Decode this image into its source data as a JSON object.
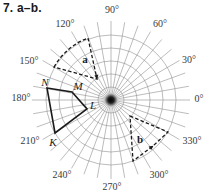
{
  "exercise_label": "7. a–b.",
  "polar_grid": {
    "center": [
      111,
      100
    ],
    "ray_step_deg": 10,
    "ray_length": 79,
    "circle_radii": [
      13,
      26,
      39,
      52,
      65
    ],
    "grid_color": "#8e8e8e"
  },
  "angle_labels": [
    {
      "text": "0°",
      "transform": "translate(199,100)"
    },
    {
      "text": "30°",
      "transform": "translate(189,61)"
    },
    {
      "text": "60°",
      "transform": "translate(160,25)"
    },
    {
      "text": "90°",
      "transform": "translate(112,11)"
    },
    {
      "text": "120°",
      "transform": "translate(65,25)"
    },
    {
      "text": "150°",
      "transform": "translate(29,62)"
    },
    {
      "text": "180°",
      "transform": "translate(21,99)"
    },
    {
      "text": "210°",
      "transform": "translate(30,142)"
    },
    {
      "text": "240°",
      "transform": "translate(62,176)"
    },
    {
      "text": "270°",
      "transform": "translate(112,188)"
    },
    {
      "text": "300°",
      "transform": "translate(159,176)"
    },
    {
      "text": "330°",
      "transform": "translate(192,142)"
    }
  ],
  "quadrilateral": {
    "points": "47,88 72,92 87,109 55,133",
    "color": "#1a1a1a",
    "vertices": [
      {
        "name": "N",
        "transform": "translate(45,83)"
      },
      {
        "name": "M",
        "transform": "translate(78,87)"
      },
      {
        "name": "L",
        "transform": "translate(93,106)"
      },
      {
        "name": "K",
        "transform": "translate(53,143)"
      }
    ]
  },
  "regions": [
    {
      "label": "a",
      "label_transform": "translate(85,60)",
      "path": "M54,67 A66,66 0 0 1 88,38 L97,79 Z",
      "arrow": "M97,79.5 L98.4,74.6 L94.4,75.6 Z"
    },
    {
      "label": "b",
      "label_transform": "translate(140,140)",
      "path": "M130,116 L168,132 L153,146 L133,161 Z",
      "arrow": "M153.5,145.8 L151.2,150.1 L148.6,146.6 Z"
    }
  ]
}
